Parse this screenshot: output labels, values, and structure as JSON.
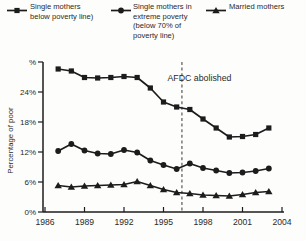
{
  "figure": {
    "background": "#fdfdfc",
    "ink_color": "#1c1c1c",
    "text_color": "#2a2a2a",
    "dash_color": "#4a4a4a"
  },
  "chart_data": {
    "type": "line",
    "title": "",
    "xlabel": "",
    "ylabel": "Percentage of poor",
    "grid": false,
    "legend_position": "top",
    "xlim": [
      1986,
      2004
    ],
    "ylim": [
      0,
      30
    ],
    "x_ticks": [
      "1986",
      "1989",
      "1992",
      "1995",
      "1998",
      "2001",
      "2004"
    ],
    "x_tick_values": [
      1986,
      1989,
      1992,
      1995,
      1998,
      2001,
      2004
    ],
    "y_ticks": [
      {
        "value": 30,
        "label": "%"
      },
      {
        "value": 24,
        "label": "24%"
      },
      {
        "value": 18,
        "label": "18%"
      },
      {
        "value": 12,
        "label": "12%"
      },
      {
        "value": 6,
        "label": "6%"
      },
      {
        "value": 0,
        "label": "0%"
      }
    ],
    "x": [
      1987,
      1988,
      1989,
      1990,
      1991,
      1992,
      1993,
      1994,
      1995,
      1996,
      1997,
      1998,
      1999,
      2000,
      2001,
      2002,
      2003
    ],
    "series": [
      {
        "name": "Single mothers below poverty line)",
        "marker": "square",
        "values": [
          28.6,
          28.2,
          26.9,
          26.8,
          26.9,
          27.1,
          26.9,
          24.8,
          22.0,
          21.0,
          20.5,
          18.6,
          16.8,
          15.0,
          15.1,
          15.5,
          16.8
        ]
      },
      {
        "name": "Single mothers in extreme poverty (below 70% of poverty line)",
        "marker": "circle",
        "values": [
          12.2,
          13.6,
          12.3,
          11.7,
          11.6,
          12.4,
          11.9,
          10.3,
          9.4,
          8.6,
          9.7,
          8.8,
          8.3,
          7.8,
          7.9,
          8.2,
          8.7
        ]
      },
      {
        "name": "Married mothers",
        "marker": "triangle",
        "values": [
          5.3,
          5.0,
          5.2,
          5.3,
          5.4,
          5.5,
          6.1,
          5.3,
          4.5,
          3.9,
          3.7,
          3.4,
          3.3,
          3.2,
          3.5,
          3.9,
          4.1
        ]
      }
    ],
    "annotation": {
      "text": "AFDC abolished",
      "x": 1996.4,
      "line_style": "dashed",
      "line_from_y": 30,
      "line_to_y": 0
    }
  }
}
